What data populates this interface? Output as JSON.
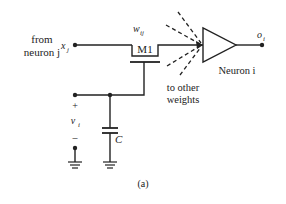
{
  "diagram": {
    "source_label_line1": "from",
    "source_label_line2": "neuron j",
    "input_var": "x",
    "input_sub": "j",
    "weight_var": "w",
    "weight_sub": "ij",
    "transistor_label": "M1",
    "other_weights_line1": "to other",
    "other_weights_line2": "weights",
    "neuron_label": "Neuron i",
    "output_var": "o",
    "output_sub": "i",
    "voltage_plus": "+",
    "voltage_var": "v",
    "voltage_sub": "i",
    "voltage_minus": "–",
    "capacitor_label": "C",
    "caption": "(a)",
    "colors": {
      "line": "#222222",
      "background": "#ffffff"
    }
  }
}
